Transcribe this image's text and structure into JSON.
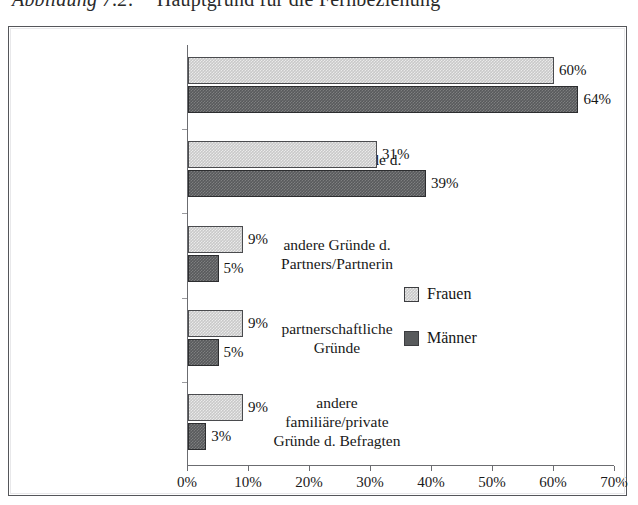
{
  "caption": {
    "number": "Abbildung 7.2:",
    "text": "Hauptgrund für die Fernbeziehung"
  },
  "legend": {
    "position": "inside-right",
    "items": [
      {
        "label": "Frauen",
        "color": "#c9c9c9",
        "swatch": "frauen"
      },
      {
        "label": "Männer",
        "color": "#585a5c",
        "swatch": "maenner"
      }
    ]
  },
  "axis": {
    "x_ticklabels": [
      "0%",
      "10%",
      "20%",
      "30%",
      "40%",
      "50%",
      "60%",
      "70%"
    ],
    "x_min": 0,
    "x_max": 70
  },
  "chart_data": {
    "type": "bar",
    "orientation": "horizontal",
    "title": "Hauptgrund für die Fernbeziehung",
    "xlabel": "",
    "ylabel": "",
    "xlim": [
      0,
      70
    ],
    "xticks": [
      0,
      10,
      20,
      30,
      40,
      50,
      60,
      70
    ],
    "xticklabels": [
      "0%",
      "10%",
      "20%",
      "30%",
      "40%",
      "50%",
      "60%",
      "70%"
    ],
    "grid": false,
    "legend_position": "inside-right",
    "value_format": "percent",
    "categories": [
      "eigene berufliche Gründe",
      "berufliche Gründe d. Partners/Partnerin",
      "andere Gründe d. Partners/Partnerin",
      "partnerschaftliche Gründe",
      "andere familiäre/private Gründe d. Befragten"
    ],
    "category_lines": [
      [
        "eigene berufliche",
        "Gründe"
      ],
      [
        "berufliche Gründe d.",
        "Partners/Partnerin"
      ],
      [
        "andere Gründe d.",
        "Partners/Partnerin"
      ],
      [
        "partnerschaftliche",
        "Gründe"
      ],
      [
        "andere",
        "familiäre/private",
        "Gründe d. Befragten"
      ]
    ],
    "series": [
      {
        "name": "Frauen",
        "color": "#c9c9c9",
        "values": [
          60,
          31,
          9,
          9,
          9
        ],
        "labels": [
          "60%",
          "31%",
          "9%",
          "9%",
          "9%"
        ]
      },
      {
        "name": "Männer",
        "color": "#585a5c",
        "values": [
          64,
          39,
          5,
          5,
          3
        ],
        "labels": [
          "64%",
          "39%",
          "5%",
          "5%",
          "3%"
        ]
      }
    ]
  }
}
